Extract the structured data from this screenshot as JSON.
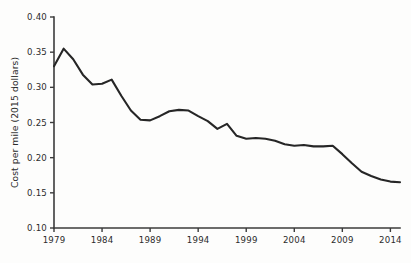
{
  "chart_data": {
    "type": "line",
    "title": "",
    "xlabel": "",
    "ylabel": "Cost per mile (2015 dollars)",
    "xlim": [
      1979,
      2015
    ],
    "ylim": [
      0.1,
      0.4
    ],
    "grid": false,
    "legend": false,
    "legend_position": "none",
    "line_color": "#262626",
    "background_color": "#fdfdfc",
    "axis_color": "#3b3b3b",
    "x_tick_labels": [
      "1979",
      "1984",
      "1989",
      "1994",
      "1999",
      "2004",
      "2009",
      "2014"
    ],
    "x_tick_values": [
      1979,
      1984,
      1989,
      1994,
      1999,
      2004,
      2009,
      2014
    ],
    "y_tick_labels": [
      "0.10",
      "0.15",
      "0.20",
      "0.25",
      "0.30",
      "0.35",
      "0.40"
    ],
    "y_tick_values": [
      0.1,
      0.15,
      0.2,
      0.25,
      0.3,
      0.35,
      0.4
    ],
    "x": [
      1979,
      1980,
      1981,
      1982,
      1983,
      1984,
      1985,
      1986,
      1987,
      1988,
      1989,
      1990,
      1991,
      1992,
      1993,
      1994,
      1995,
      1996,
      1997,
      1998,
      1999,
      2000,
      2001,
      2002,
      2003,
      2004,
      2005,
      2006,
      2007,
      2008,
      2009,
      2010,
      2011,
      2012,
      2013,
      2014,
      2015
    ],
    "values": [
      0.33,
      0.355,
      0.34,
      0.318,
      0.304,
      0.305,
      0.311,
      0.288,
      0.267,
      0.254,
      0.253,
      0.259,
      0.266,
      0.268,
      0.267,
      0.259,
      0.252,
      0.241,
      0.248,
      0.231,
      0.227,
      0.228,
      0.227,
      0.224,
      0.219,
      0.217,
      0.218,
      0.216,
      0.216,
      0.217,
      0.205,
      0.192,
      0.18,
      0.174,
      0.169,
      0.166,
      0.165
    ]
  },
  "series_detail": {
    "name": "Cost per mile",
    "points": [
      {
        "year": 1979,
        "value": 0.33
      },
      {
        "year": 1980,
        "value": 0.355
      },
      {
        "year": 1981,
        "value": 0.34
      },
      {
        "year": 1982,
        "value": 0.318
      },
      {
        "year": 1983,
        "value": 0.304
      },
      {
        "year": 1984,
        "value": 0.305
      },
      {
        "year": 1985,
        "value": 0.311
      },
      {
        "year": 1986,
        "value": 0.288
      },
      {
        "year": 1987,
        "value": 0.267
      },
      {
        "year": 1988,
        "value": 0.254
      },
      {
        "year": 1989,
        "value": 0.253
      },
      {
        "year": 1990,
        "value": 0.259
      },
      {
        "year": 1991,
        "value": 0.266
      },
      {
        "year": 1992,
        "value": 0.268
      },
      {
        "year": 1993,
        "value": 0.267
      },
      {
        "year": 1994,
        "value": 0.259
      },
      {
        "year": 1995,
        "value": 0.252
      },
      {
        "year": 1996,
        "value": 0.241
      },
      {
        "year": 1997,
        "value": 0.248
      },
      {
        "year": 1998,
        "value": 0.231
      },
      {
        "year": 1999,
        "value": 0.227
      },
      {
        "year": 2000,
        "value": 0.228
      },
      {
        "year": 2001,
        "value": 0.227
      },
      {
        "year": 2002,
        "value": 0.224
      },
      {
        "year": 2003,
        "value": 0.219
      },
      {
        "year": 2004,
        "value": 0.217
      },
      {
        "year": 2005,
        "value": 0.218
      },
      {
        "year": 2006,
        "value": 0.216
      },
      {
        "year": 2007,
        "value": 0.216
      },
      {
        "year": 2008,
        "value": 0.217
      },
      {
        "year": 2009,
        "value": 0.205
      },
      {
        "year": 2010,
        "value": 0.192
      },
      {
        "year": 2011,
        "value": 0.18
      },
      {
        "year": 2012,
        "value": 0.174
      },
      {
        "year": 2013,
        "value": 0.169
      },
      {
        "year": 2014,
        "value": 0.166
      },
      {
        "year": 2015,
        "value": 0.165
      }
    ]
  }
}
